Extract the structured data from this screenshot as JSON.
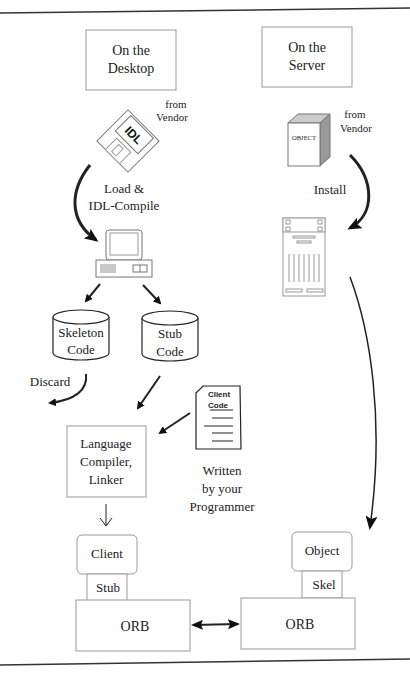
{
  "diagram": {
    "type": "corba-development-flow",
    "desktop": {
      "header": [
        "On the",
        "Desktop"
      ],
      "idl_disk": {
        "label": "IDL",
        "source": [
          "from",
          "Vendor"
        ]
      },
      "load_step": [
        "Load &",
        "IDL-Compile"
      ],
      "generated": {
        "skeleton": [
          "Skeleton",
          "Code"
        ],
        "stub": [
          "Stub",
          "Code"
        ]
      },
      "discard_label": "Discard",
      "client_code_doc": [
        "Client",
        "Code"
      ],
      "written_by": [
        "Written",
        "by your",
        "Programmer"
      ],
      "compiler": [
        "Language",
        "Compiler,",
        "Linker"
      ],
      "client": "Client",
      "stub": "Stub",
      "orb": "ORB"
    },
    "server": {
      "header": [
        "On the",
        "Server"
      ],
      "object_box": {
        "label": "OBJECT",
        "source": [
          "from",
          "Vendor"
        ]
      },
      "install_step": "Install",
      "object": "Object",
      "skel": "Skel",
      "orb": "ORB"
    },
    "connections": [
      {
        "from": "idl_disk",
        "to": "desktop_computer",
        "label": "Load & IDL-Compile"
      },
      {
        "from": "desktop_computer",
        "to": "skeleton_code"
      },
      {
        "from": "desktop_computer",
        "to": "stub_code"
      },
      {
        "from": "skeleton_code",
        "to": "discard"
      },
      {
        "from": "stub_code",
        "to": "compiler"
      },
      {
        "from": "client_code",
        "to": "compiler"
      },
      {
        "from": "compiler",
        "to": "client"
      },
      {
        "from": "object_box",
        "to": "server_machine",
        "label": "Install"
      },
      {
        "from": "server_machine",
        "to": "object"
      },
      {
        "from": "client_orb",
        "to": "server_orb",
        "bidirectional": true
      }
    ]
  }
}
